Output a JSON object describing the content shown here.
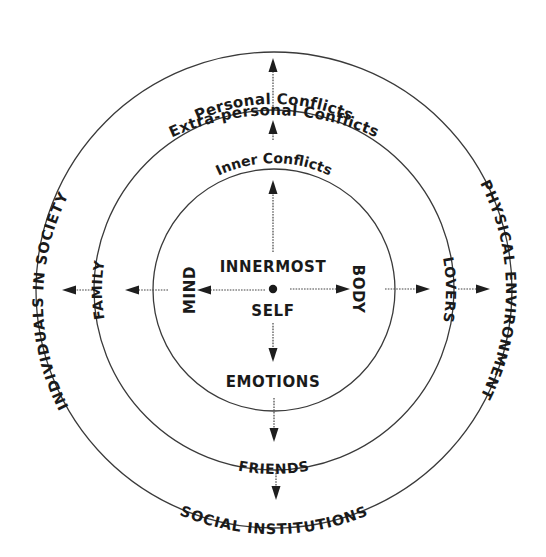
{
  "diagram": {
    "center_labels": {
      "line1": "INNERMOST",
      "line2": "SELF"
    },
    "rings": [
      {
        "name": "inner",
        "title": "Inner Conflicts",
        "top": "",
        "left": "MIND",
        "right": "BODY",
        "bottom": "EMOTIONS"
      },
      {
        "name": "middle",
        "title": "Personal Conflicts",
        "left": "FAMILY",
        "right": "LOVERS",
        "bottom": "FRIENDS"
      },
      {
        "name": "outer",
        "title": "Extra-personal Conflicts",
        "left": "INDIVIDUALS IN SOCIETY",
        "right": "PHYSICAL ENVIRONMENT",
        "bottom": "SOCIAL INSTITUTIONS"
      }
    ],
    "colors": {
      "ink": "#1a1a1a",
      "line": "#3a3a3a",
      "background": "#ffffff"
    }
  }
}
